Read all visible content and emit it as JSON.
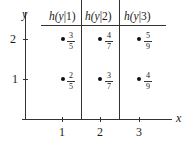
{
  "axes": {
    "x_label": "x",
    "y_label": "y",
    "x_ticks": [
      "1",
      "2",
      "3"
    ],
    "y_ticks": [
      "1",
      "2"
    ]
  },
  "columns": [
    {
      "header_prefix": "h(",
      "header_var": "y",
      "header_sep": "|",
      "header_cond": "1",
      "header_suffix": ")",
      "points": [
        {
          "y": "2",
          "num": "3",
          "den": "5"
        },
        {
          "y": "1",
          "num": "2",
          "den": "5"
        }
      ]
    },
    {
      "header_prefix": "h(",
      "header_var": "y",
      "header_sep": "|",
      "header_cond": "2",
      "header_suffix": ")",
      "points": [
        {
          "y": "2",
          "num": "4",
          "den": "7"
        },
        {
          "y": "1",
          "num": "3",
          "den": "7"
        }
      ]
    },
    {
      "header_prefix": "h(",
      "header_var": "y",
      "header_sep": "|",
      "header_cond": "3",
      "header_suffix": ")",
      "points": [
        {
          "y": "2",
          "num": "5",
          "den": "9"
        },
        {
          "y": "1",
          "num": "4",
          "den": "9"
        }
      ]
    }
  ],
  "headers": [
    "h(y|1)",
    "h(y|2)",
    "h(y|3)"
  ]
}
